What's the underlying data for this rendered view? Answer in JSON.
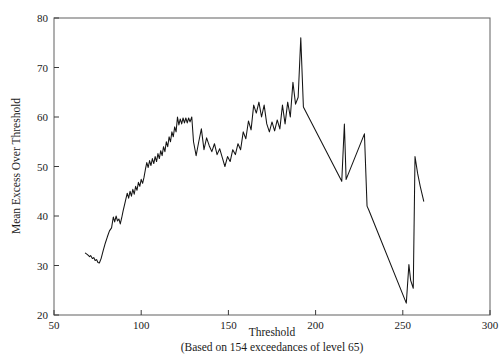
{
  "chart_data": {
    "type": "line",
    "title": "",
    "subtitle": "",
    "xlabel": "Threshold",
    "ylabel": "Mean Excess Over Threshold",
    "caption": "(Based on 154 exceedances of level 65)",
    "xlim": [
      50,
      300
    ],
    "ylim": [
      20,
      80
    ],
    "xticks": [
      50,
      100,
      150,
      200,
      250,
      300
    ],
    "yticks": [
      20,
      30,
      40,
      50,
      60,
      70,
      80
    ],
    "xtick_labels": [
      "50",
      "100",
      "150",
      "200",
      "250",
      "300"
    ],
    "ytick_labels": [
      "20",
      "30",
      "40",
      "50",
      "60",
      "70",
      "80"
    ],
    "grid": false,
    "legend": false,
    "legend_position": "none",
    "line_color": "#141414",
    "axis_color": "#6e6e6e",
    "series": [
      {
        "name": "Mean excess over threshold",
        "x": [
          68.0,
          69.2,
          70.4,
          71.0,
          72.0,
          72.8,
          73.6,
          74.4,
          75.2,
          76.0,
          77.0,
          78.2,
          79.4,
          80.6,
          81.8,
          83.0,
          84.0,
          84.8,
          85.6,
          86.4,
          87.2,
          88.0,
          88.8,
          89.6,
          90.4,
          91.2,
          92.0,
          92.8,
          93.6,
          94.4,
          95.2,
          96.0,
          96.8,
          97.6,
          98.4,
          99.2,
          100.0,
          100.8,
          101.6,
          102.4,
          103.2,
          104.0,
          104.8,
          105.6,
          106.4,
          107.2,
          108.0,
          108.8,
          109.6,
          110.4,
          111.2,
          112.0,
          112.8,
          113.6,
          114.4,
          115.2,
          116.0,
          116.8,
          117.6,
          118.4,
          119.2,
          120.0,
          120.8,
          121.6,
          122.4,
          123.2,
          124.0,
          124.8,
          125.6,
          126.4,
          127.2,
          128.0,
          129.0,
          130.0,
          131.5,
          133.0,
          134.5,
          136.0,
          137.5,
          139.0,
          140.5,
          142.0,
          143.5,
          145.0,
          146.5,
          148.0,
          149.5,
          151.0,
          152.5,
          154.0,
          155.5,
          157.0,
          158.5,
          160.0,
          161.5,
          163.0,
          164.5,
          166.0,
          167.5,
          169.0,
          170.5,
          172.0,
          173.5,
          175.0,
          176.5,
          178.0,
          179.5,
          181.0,
          182.5,
          184.0,
          185.5,
          187.0,
          188.5,
          190.0,
          191.5,
          193.0,
          215.0,
          216.5,
          217.5,
          228.0,
          229.5,
          230.5,
          252.0,
          253.5,
          254.5,
          256.0,
          257.0,
          258.5,
          260.0,
          262.0
        ],
        "y": [
          32.5,
          32.2,
          31.8,
          32.0,
          31.4,
          31.6,
          31.0,
          31.2,
          30.6,
          30.5,
          31.4,
          33.0,
          34.5,
          35.8,
          37.0,
          37.6,
          39.8,
          38.8,
          40.0,
          39.0,
          39.4,
          38.4,
          39.6,
          41.0,
          42.2,
          43.4,
          44.6,
          43.6,
          45.0,
          44.0,
          45.4,
          44.4,
          46.0,
          45.2,
          46.8,
          46.0,
          47.4,
          46.6,
          47.8,
          49.4,
          50.8,
          49.8,
          51.2,
          50.2,
          51.6,
          50.6,
          52.0,
          51.0,
          52.6,
          51.6,
          53.2,
          52.2,
          54.0,
          53.0,
          55.0,
          54.0,
          56.0,
          55.0,
          57.0,
          56.0,
          58.0,
          57.0,
          60.0,
          58.4,
          59.6,
          58.6,
          59.8,
          58.8,
          59.8,
          58.8,
          59.8,
          59.0,
          60.0,
          55.0,
          52.2,
          55.0,
          57.6,
          53.4,
          55.8,
          54.2,
          53.0,
          54.6,
          52.4,
          53.6,
          51.8,
          50.0,
          52.0,
          51.0,
          53.4,
          52.4,
          54.6,
          53.4,
          57.0,
          55.6,
          59.2,
          57.4,
          62.4,
          60.8,
          63.0,
          60.0,
          62.4,
          58.6,
          57.0,
          59.0,
          57.2,
          59.4,
          57.6,
          62.4,
          58.6,
          63.0,
          60.0,
          67.0,
          62.6,
          64.0,
          76.0,
          62.0,
          47.0,
          58.6,
          47.4,
          56.6,
          42.0,
          41.2,
          22.4,
          30.2,
          27.0,
          25.4,
          52.0,
          48.6,
          46.0,
          43.0
        ]
      }
    ]
  },
  "axes": {
    "y_title": "Mean Excess Over Threshold",
    "x_title": "Threshold",
    "caption": "(Based on 154 exceedances of level 65)"
  }
}
